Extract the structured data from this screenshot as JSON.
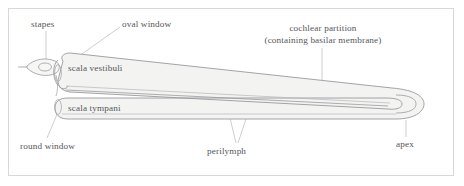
{
  "figure": {
    "background_color": "#ffffff",
    "frame_color": "#d8d8d6",
    "label_color": "#56565a",
    "outline_color": "#8f8f93",
    "fill_color": "#f3f3f2",
    "leader_color": "#bdbdbd"
  },
  "labels": {
    "stapes": "stapes",
    "oval_window": "oval window",
    "cochlear_partition_line1": "cochlear partition",
    "cochlear_partition_line2": "(containing basilar membrane)",
    "scala_vestibuli": "scala vestibuli",
    "scala_tympani": "scala tympani",
    "round_window": "round window",
    "perilymph": "perilymph",
    "apex": "apex"
  },
  "parts": [
    {
      "name": "stapes",
      "label": "stapes"
    },
    {
      "name": "oval-window",
      "label": "oval window"
    },
    {
      "name": "cochlear-partition",
      "label": "cochlear partition (containing basilar membrane)"
    },
    {
      "name": "scala-vestibuli",
      "label": "scala vestibuli"
    },
    {
      "name": "scala-tympani",
      "label": "scala tympani"
    },
    {
      "name": "round-window",
      "label": "round window"
    },
    {
      "name": "perilymph",
      "label": "perilymph"
    },
    {
      "name": "apex",
      "label": "apex"
    }
  ]
}
